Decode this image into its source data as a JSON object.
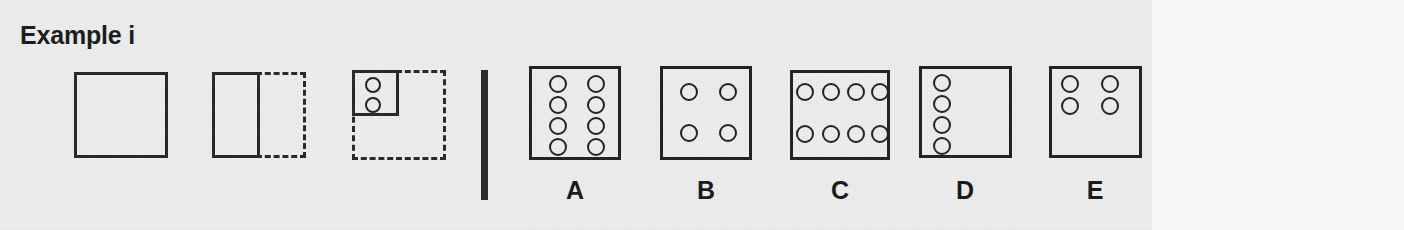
{
  "page": {
    "title": "Example i",
    "background_color": "#ececec",
    "right_margin_color": "#f7f7f7",
    "ink_color": "#232323",
    "width": 1404,
    "height": 230
  },
  "stem": {
    "name": "matrix-analogy-stem",
    "figures": [
      {
        "id": "stem-1",
        "description": "empty solid square",
        "solid": {
          "x": 74,
          "y": 72,
          "w": 94,
          "h": 86
        },
        "dashed": null,
        "dots": []
      },
      {
        "id": "stem-2",
        "description": "solid left half rectangle inside dashed full square",
        "solid": {
          "x": 212,
          "y": 72,
          "w": 48,
          "h": 86
        },
        "dashed": {
          "x": 212,
          "y": 72,
          "w": 94,
          "h": 86
        },
        "dots": []
      },
      {
        "id": "stem-3",
        "description": "solid top-left quarter square with two circles inside dashed full square",
        "solid": {
          "x": 352,
          "y": 70,
          "w": 47,
          "h": 46
        },
        "dashed": {
          "x": 352,
          "y": 70,
          "w": 94,
          "h": 90
        },
        "dots": [
          {
            "cx": 373,
            "cy": 85,
            "r": 8
          },
          {
            "cx": 373,
            "cy": 105,
            "r": 8
          }
        ]
      }
    ]
  },
  "divider": {
    "name": "stem-options-divider",
    "x": 481,
    "y": 70,
    "w": 7,
    "h": 130
  },
  "options": [
    {
      "label": "A",
      "box": {
        "x": 529,
        "y": 66,
        "w": 92,
        "h": 94
      },
      "dot_count": 8,
      "arrangement": "2 columns x 4 rows, spread over full square",
      "dots": [
        {
          "cx": 558,
          "cy": 84,
          "r": 9
        },
        {
          "cx": 558,
          "cy": 105,
          "r": 9
        },
        {
          "cx": 558,
          "cy": 126,
          "r": 9
        },
        {
          "cx": 558,
          "cy": 147,
          "r": 9
        },
        {
          "cx": 596,
          "cy": 84,
          "r": 9
        },
        {
          "cx": 596,
          "cy": 105,
          "r": 9
        },
        {
          "cx": 596,
          "cy": 126,
          "r": 9
        },
        {
          "cx": 596,
          "cy": 147,
          "r": 9
        }
      ],
      "label_pos": {
        "x": 575,
        "y": 176
      }
    },
    {
      "label": "B",
      "box": {
        "x": 660,
        "y": 66,
        "w": 92,
        "h": 94
      },
      "dot_count": 4,
      "arrangement": "2 columns x 2 rows, centred in square",
      "dots": [
        {
          "cx": 689,
          "cy": 92,
          "r": 9
        },
        {
          "cx": 728,
          "cy": 92,
          "r": 9
        },
        {
          "cx": 689,
          "cy": 133,
          "r": 9
        },
        {
          "cx": 728,
          "cy": 133,
          "r": 9
        }
      ],
      "label_pos": {
        "x": 706,
        "y": 176
      }
    },
    {
      "label": "C",
      "box": {
        "x": 790,
        "y": 70,
        "w": 100,
        "h": 90
      },
      "dot_count": 8,
      "arrangement": "4 columns x 2 rows, spread over full square",
      "dots": [
        {
          "cx": 805,
          "cy": 92,
          "r": 9
        },
        {
          "cx": 831,
          "cy": 92,
          "r": 9
        },
        {
          "cx": 856,
          "cy": 92,
          "r": 9
        },
        {
          "cx": 880,
          "cy": 92,
          "r": 9
        },
        {
          "cx": 805,
          "cy": 134,
          "r": 9
        },
        {
          "cx": 831,
          "cy": 134,
          "r": 9
        },
        {
          "cx": 856,
          "cy": 134,
          "r": 9
        },
        {
          "cx": 880,
          "cy": 134,
          "r": 9
        }
      ],
      "label_pos": {
        "x": 840,
        "y": 176
      }
    },
    {
      "label": "D",
      "box": {
        "x": 919,
        "y": 66,
        "w": 93,
        "h": 92
      },
      "dot_count": 4,
      "arrangement": "1 column x 4 rows, left edge",
      "dots": [
        {
          "cx": 942,
          "cy": 83,
          "r": 9
        },
        {
          "cx": 942,
          "cy": 104,
          "r": 9
        },
        {
          "cx": 942,
          "cy": 125,
          "r": 9
        },
        {
          "cx": 942,
          "cy": 146,
          "r": 9
        }
      ],
      "label_pos": {
        "x": 965,
        "y": 176
      }
    },
    {
      "label": "E",
      "box": {
        "x": 1049,
        "y": 66,
        "w": 93,
        "h": 92
      },
      "dot_count": 4,
      "arrangement": "2 columns x 2 rows, confined to top-left quarter",
      "dots": [
        {
          "cx": 1070,
          "cy": 84,
          "r": 9
        },
        {
          "cx": 1110,
          "cy": 84,
          "r": 9
        },
        {
          "cx": 1070,
          "cy": 106,
          "r": 9
        },
        {
          "cx": 1110,
          "cy": 106,
          "r": 9
        }
      ],
      "label_pos": {
        "x": 1095,
        "y": 176
      }
    }
  ]
}
